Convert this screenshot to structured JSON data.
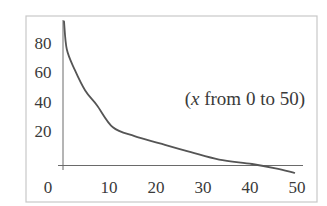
{
  "chart_data": {
    "type": "line",
    "title": "",
    "xlabel": "",
    "ylabel": "",
    "xlim": [
      0,
      50
    ],
    "ylim": [
      0,
      90
    ],
    "grid": false,
    "legend": "none",
    "x_ticks": [
      0,
      10,
      20,
      30,
      40,
      50
    ],
    "x_tick_labels": [
      "0",
      "10",
      "20",
      "30",
      "40",
      "50"
    ],
    "y_ticks": [
      20,
      40,
      60,
      80
    ],
    "y_tick_labels": [
      "20",
      "40",
      "60",
      "80"
    ],
    "annotation": {
      "prefix": "(",
      "variable": "x",
      "suffix": " from 0 to 50)",
      "full_text": "(x from 0 to 50)"
    },
    "series": [
      {
        "name": "decreasing curve",
        "color": "#555555",
        "x": [
          0.0,
          0.6,
          2.3,
          4.5,
          7,
          10.4,
          15,
          20.4,
          27,
          33,
          40,
          45,
          49
        ],
        "y": [
          97,
          78,
          64,
          50,
          40,
          25,
          19,
          14,
          8,
          3,
          0,
          -3,
          -6
        ]
      }
    ]
  }
}
